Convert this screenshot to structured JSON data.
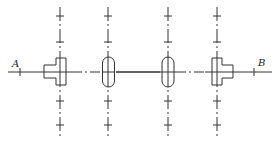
{
  "diagram": {
    "type": "shaft alignment schematic",
    "stroke_color": "#333333",
    "background": "#ffffff",
    "labels": {
      "start": "A",
      "end": "B"
    },
    "axis_line": {
      "y": 72,
      "x_start": 8,
      "x_end": 272
    },
    "supports": [
      {
        "id": "left-bracket",
        "shape": "T-block",
        "x": 60
      },
      {
        "id": "left-bearing",
        "shape": "obround",
        "x": 108
      },
      {
        "id": "right-bearing",
        "shape": "obround",
        "x": 168
      },
      {
        "id": "right-bracket",
        "shape": "T-block",
        "x": 217
      }
    ],
    "tick_marks_y": [
      16,
      42,
      101,
      125
    ]
  }
}
